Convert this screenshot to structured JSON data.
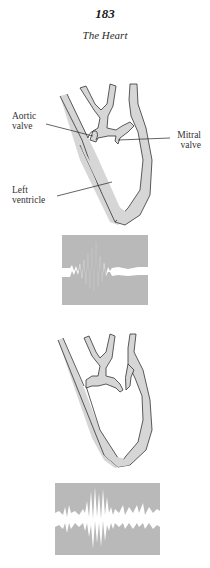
{
  "header": {
    "page_number": "183",
    "title": "The Heart"
  },
  "figure_1": {
    "labels": {
      "aortic_valve_line1": "Aortic",
      "aortic_valve_line2": "valve",
      "mitral_valve_line1": "Mitral",
      "mitral_valve_line2": "valve",
      "left_ventricle_line1": "Left",
      "left_ventricle_line2": "ventricle"
    },
    "waveform": "Sound recording panel: short burst of high-amplitude vibration on a flatter baseline"
  },
  "figure_2": {
    "waveform": "Sound recording panel: continuous noisy baseline with central high-amplitude burst"
  },
  "colors": {
    "tissue_fill": "#d6d6d6",
    "outline": "#333333",
    "waveform_background": "#b9b9b9",
    "waveform_trace": "#ffffff"
  }
}
